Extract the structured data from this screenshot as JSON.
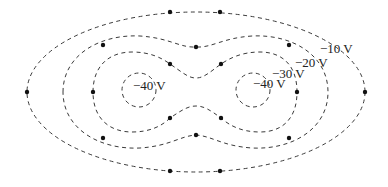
{
  "diagram": {
    "contours": [
      {
        "id": "outer",
        "label": "−10 V",
        "value": -10
      },
      {
        "id": "mid",
        "label": "−20 V",
        "value": -20
      },
      {
        "id": "inner",
        "label": "−30 V",
        "value": -30
      },
      {
        "id": "left-core",
        "label": "−40 V",
        "value": -40
      },
      {
        "id": "right-core",
        "label": "−40 V",
        "value": -40
      }
    ],
    "labels": {
      "minus10": "−10 V",
      "minus20": "−20 V",
      "minus30": "−30 V",
      "minus40_left": "−40 V",
      "minus40_right": "−40 V"
    },
    "line_style": "dashed",
    "line_color": "#3a3a3a",
    "dot_color": "#111111"
  }
}
